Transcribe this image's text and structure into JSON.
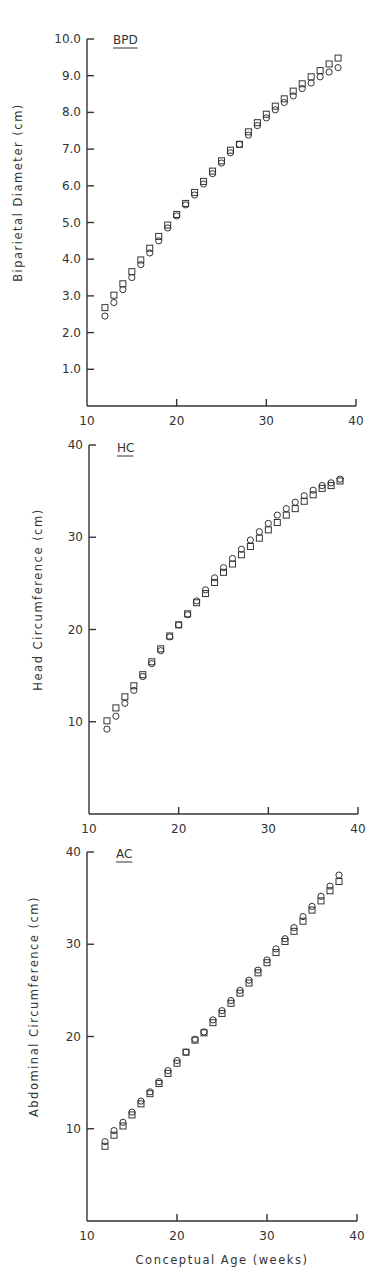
{
  "chart_data": [
    {
      "type": "scatter",
      "panel_label": "BPD",
      "title": "",
      "xlabel": "",
      "ylabel": "Biparietal Diameter (cm)",
      "xlim": [
        10,
        40
      ],
      "ylim": [
        0,
        10
      ],
      "xticks": [
        "10",
        "20",
        "30",
        "40"
      ],
      "yticks": [
        "1.0",
        "2.0",
        "3.0",
        "4.0",
        "5.0",
        "6.0",
        "7.0",
        "8.0",
        "9.0",
        "10.0"
      ],
      "grid": false,
      "x": [
        12,
        13,
        14,
        15,
        16,
        17,
        18,
        19,
        20,
        21,
        22,
        23,
        24,
        25,
        26,
        27,
        28,
        29,
        30,
        31,
        32,
        33,
        34,
        35,
        36,
        37,
        38
      ],
      "series": [
        {
          "name": "squares",
          "marker": "square",
          "values": [
            2.68,
            3.02,
            3.33,
            3.66,
            3.98,
            4.3,
            4.62,
            4.93,
            5.22,
            5.52,
            5.82,
            6.12,
            6.4,
            6.68,
            6.97,
            7.13,
            7.47,
            7.72,
            7.95,
            8.17,
            8.37,
            8.58,
            8.78,
            8.97,
            9.14,
            9.32,
            9.48
          ]
        },
        {
          "name": "circles",
          "marker": "circle",
          "values": [
            2.45,
            2.82,
            3.17,
            3.5,
            3.85,
            4.17,
            4.5,
            4.85,
            5.18,
            5.48,
            5.75,
            6.05,
            6.33,
            6.62,
            6.9,
            7.13,
            7.38,
            7.64,
            7.85,
            8.07,
            8.27,
            8.45,
            8.65,
            8.8,
            8.97,
            9.1,
            9.22
          ]
        }
      ]
    },
    {
      "type": "scatter",
      "panel_label": "HC",
      "title": "",
      "xlabel": "",
      "ylabel": "Head Circumference (cm)",
      "xlim": [
        10,
        40
      ],
      "ylim": [
        0,
        40
      ],
      "xticks": [
        "10",
        "20",
        "30",
        "40"
      ],
      "yticks": [
        "10",
        "20",
        "30",
        "40"
      ],
      "grid": false,
      "x": [
        12,
        13,
        14,
        15,
        16,
        17,
        18,
        19,
        20,
        21,
        22,
        23,
        24,
        25,
        26,
        27,
        28,
        29,
        30,
        31,
        32,
        33,
        34,
        35,
        36,
        37,
        38
      ],
      "series": [
        {
          "name": "squares",
          "marker": "square",
          "values": [
            10.1,
            11.5,
            12.7,
            13.9,
            15.1,
            16.5,
            17.9,
            19.3,
            20.5,
            21.7,
            22.9,
            23.9,
            25.1,
            26.2,
            27.1,
            28.1,
            29.0,
            29.9,
            30.8,
            31.6,
            32.4,
            33.1,
            33.9,
            34.6,
            35.3,
            35.6,
            36.1
          ]
        },
        {
          "name": "circles",
          "marker": "circle",
          "values": [
            9.2,
            10.6,
            12.0,
            13.4,
            14.9,
            16.3,
            17.7,
            19.2,
            20.5,
            21.6,
            23.1,
            24.3,
            25.6,
            26.7,
            27.7,
            28.7,
            29.7,
            30.6,
            31.5,
            32.4,
            33.1,
            33.8,
            34.5,
            35.1,
            35.6,
            35.9,
            36.3
          ]
        }
      ]
    },
    {
      "type": "scatter",
      "panel_label": "AC",
      "title": "",
      "xlabel": "Conceptual Age (weeks)",
      "ylabel": "Abdominal Circumference (cm)",
      "xlim": [
        10,
        40
      ],
      "ylim": [
        0,
        40
      ],
      "xticks": [
        "10",
        "20",
        "30",
        "40"
      ],
      "yticks": [
        "10",
        "20",
        "30",
        "40"
      ],
      "grid": false,
      "x": [
        12,
        13,
        14,
        15,
        16,
        17,
        18,
        19,
        20,
        21,
        22,
        23,
        24,
        25,
        26,
        27,
        28,
        29,
        30,
        31,
        32,
        33,
        34,
        35,
        36,
        37,
        38
      ],
      "series": [
        {
          "name": "squares",
          "marker": "square",
          "values": [
            8.1,
            9.3,
            10.3,
            11.5,
            12.7,
            13.8,
            14.9,
            16.0,
            17.1,
            18.3,
            19.6,
            20.4,
            21.5,
            22.5,
            23.6,
            24.7,
            25.8,
            26.9,
            28.0,
            29.1,
            30.3,
            31.4,
            32.5,
            33.7,
            34.7,
            35.8,
            36.8
          ]
        },
        {
          "name": "circles",
          "marker": "circle",
          "values": [
            8.6,
            9.8,
            10.7,
            11.8,
            13.0,
            14.0,
            15.1,
            16.3,
            17.4,
            18.3,
            19.7,
            20.5,
            21.8,
            22.8,
            23.9,
            25.0,
            26.1,
            27.2,
            28.3,
            29.5,
            30.6,
            31.8,
            33.0,
            34.1,
            35.2,
            36.3,
            37.5
          ]
        }
      ]
    }
  ],
  "layout": {
    "panels": [
      {
        "x0": 87,
        "x1": 356,
        "y_top": 39,
        "y_bottom": 406,
        "ymax": 10,
        "ylabel_x": 22,
        "panel_label_x": 113,
        "panel_label_y": 44
      },
      {
        "x0": 89,
        "x1": 358,
        "y_top": 445,
        "y_bottom": 814,
        "ymax": 40,
        "ylabel_x": 42,
        "panel_label_x": 117,
        "panel_label_y": 452
      },
      {
        "x0": 87,
        "x1": 357,
        "y_top": 852,
        "y_bottom": 1221,
        "ymax": 40,
        "ylabel_x": 38,
        "panel_label_x": 116,
        "panel_label_y": 858
      }
    ],
    "xlabel_y": 1264
  }
}
